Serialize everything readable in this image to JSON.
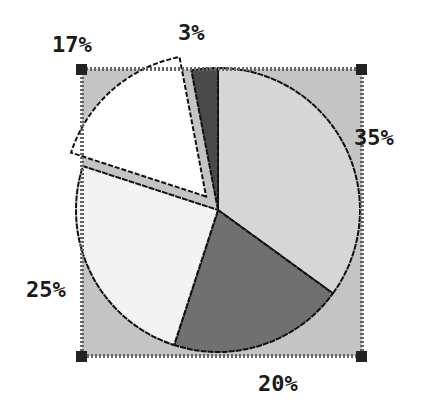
{
  "chart_data": {
    "type": "pie",
    "title": "",
    "categories": [
      "Slice A",
      "Slice B",
      "Slice C",
      "Slice D",
      "Slice E"
    ],
    "values": [
      35,
      20,
      25,
      17,
      3
    ],
    "labels": [
      "35%",
      "20%",
      "25%",
      "17%",
      "3%"
    ],
    "colors": [
      "#d6d6d6",
      "#707070",
      "#f3f3f3",
      "#ffffff",
      "#4a4a4a"
    ],
    "exploded": [
      false,
      false,
      false,
      true,
      false
    ],
    "start_angle_deg": 0,
    "direction": "clockwise",
    "plot_area_color": "#c4c4c4",
    "legend": "none",
    "selected": true
  },
  "labels": {
    "p35": "35%",
    "p20": "20%",
    "p25": "25%",
    "p17": "17%",
    "p3": "3%"
  }
}
